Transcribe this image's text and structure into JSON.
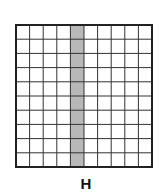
{
  "figure": {
    "label": "H",
    "grid": {
      "rows": 10,
      "columns": 10,
      "shaded_columns": [
        4
      ],
      "shaded_column_number": 5,
      "shaded_cells": 10,
      "total_cells": 100,
      "shade_color": "#b8b8b8",
      "line_color": "#333333",
      "background_color": "#ffffff"
    }
  }
}
